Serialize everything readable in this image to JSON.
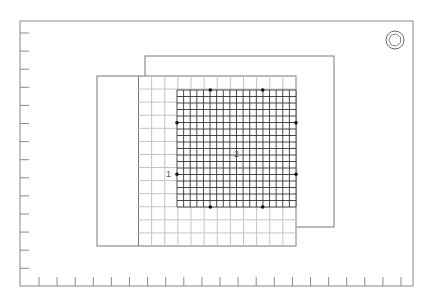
{
  "diagram": {
    "labels": {
      "region_1": "1",
      "region_2": "2"
    },
    "icons": {
      "orientation": "rotation-orientation-icon"
    },
    "frame": {
      "left_ticks": 14,
      "bottom_ticks": 21
    },
    "light_grid": {
      "columns": 12,
      "rows": 13
    },
    "dark_grid": {
      "columns": 18,
      "rows": 18
    },
    "handles": {
      "count": 8
    },
    "colors": {
      "frame": "#8a8a8a",
      "rect_outline": "#777777",
      "light_grid": "#c4c4c4",
      "dark_grid": "#333333",
      "handle": "#111111",
      "background": "#ffffff"
    }
  }
}
